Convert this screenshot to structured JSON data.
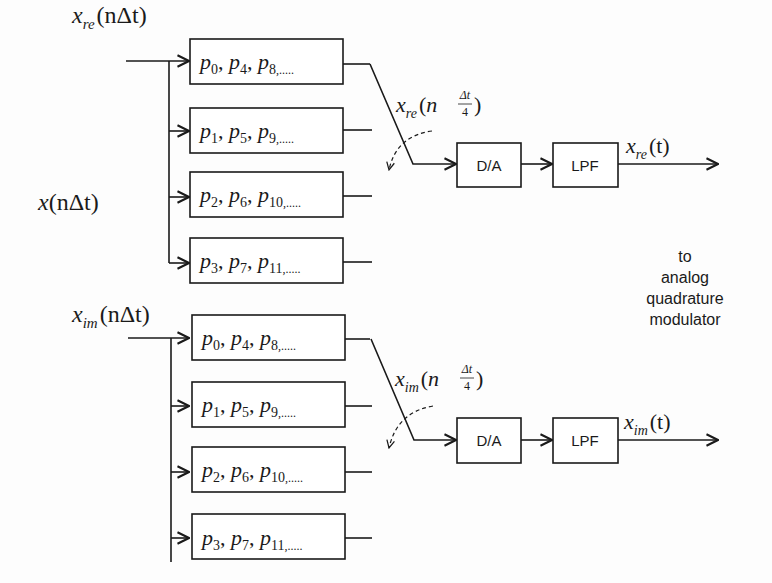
{
  "diagram": {
    "input_label": {
      "base": "x",
      "arg": "(nΔt)"
    },
    "note": [
      "to",
      "analog",
      "quadrature",
      "modulator"
    ],
    "branches": [
      {
        "id": "re",
        "input": {
          "base": "x",
          "sub": "re",
          "arg": "(nΔt)"
        },
        "phases": [
          {
            "p": [
              "0",
              "4",
              "8"
            ],
            "tail": ",....."
          },
          {
            "p": [
              "1",
              "5",
              "9"
            ],
            "tail": ",....."
          },
          {
            "p": [
              "2",
              "6",
              "10"
            ],
            "tail": ",....."
          },
          {
            "p": [
              "3",
              "7",
              "11"
            ],
            "tail": ",....."
          }
        ],
        "mux_output": {
          "base": "x",
          "sub": "re",
          "arg_prefix": "(n",
          "frac_num": "Δt",
          "frac_den": "4",
          "arg_suffix": ")"
        },
        "dac_label": "D/A",
        "lpf_label": "LPF",
        "output": {
          "base": "x",
          "sub": "re",
          "arg": "(t)"
        }
      },
      {
        "id": "im",
        "input": {
          "base": "x",
          "sub": "im",
          "arg": "(nΔt)"
        },
        "phases": [
          {
            "p": [
              "0",
              "4",
              "8"
            ],
            "tail": ",....."
          },
          {
            "p": [
              "1",
              "5",
              "9"
            ],
            "tail": ",....."
          },
          {
            "p": [
              "2",
              "6",
              "10"
            ],
            "tail": ",....."
          },
          {
            "p": [
              "3",
              "7",
              "11"
            ],
            "tail": ",....."
          }
        ],
        "mux_output": {
          "base": "x",
          "sub": "im",
          "arg_prefix": "(n",
          "frac_num": "Δt",
          "frac_den": "4",
          "arg_suffix": ")"
        },
        "dac_label": "D/A",
        "lpf_label": "LPF",
        "output": {
          "base": "x",
          "sub": "im",
          "arg": "(t)"
        }
      }
    ]
  }
}
